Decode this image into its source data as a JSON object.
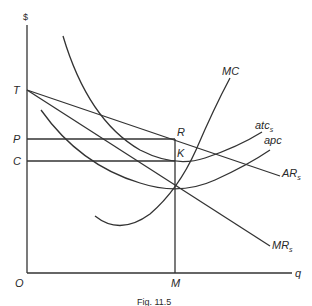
{
  "figure": {
    "caption": "Fig. 11.5",
    "axes": {
      "y_label": "$",
      "x_label": "q",
      "origin_label": "O"
    },
    "price_levels": [
      {
        "label": "T",
        "description": "vertical intercept of AR and MR"
      },
      {
        "label": "P",
        "description": "price at R"
      },
      {
        "label": "C",
        "description": "cost at K"
      }
    ],
    "quantity_levels": [
      {
        "label": "M",
        "description": "profit-maximizing output"
      }
    ],
    "points": [
      {
        "label": "R"
      },
      {
        "label": "K"
      }
    ],
    "curves": [
      {
        "name": "MC",
        "label": "MC",
        "subscript": ""
      },
      {
        "name": "atc_s",
        "label": "atc",
        "subscript": "s"
      },
      {
        "name": "apc",
        "label": "apc",
        "subscript": ""
      },
      {
        "name": "AR_s",
        "label": "AR",
        "subscript": "s"
      },
      {
        "name": "MR_s",
        "label": "MR",
        "subscript": "s"
      }
    ],
    "colors": {
      "line": "#333333",
      "text": "#2a2a2a",
      "background": "#ffffff"
    }
  }
}
